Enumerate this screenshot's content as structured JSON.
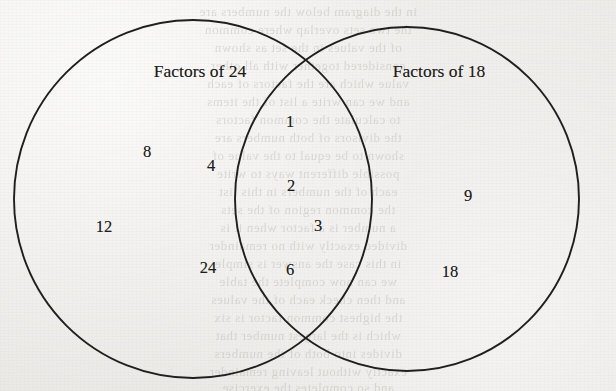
{
  "diagram": {
    "type": "venn-2-set",
    "title_left": "Factors of 24",
    "title_right": "Factors of 18",
    "stroke_color": "#201f1d",
    "background_color": "#efeeec",
    "text_color": "#1e1d1c",
    "left_circle": {
      "cx": 193,
      "cy": 199,
      "r": 179
    },
    "right_circle": {
      "cx": 407,
      "cy": 199,
      "r": 172
    },
    "labels": [
      {
        "name": "left-set-label",
        "text": "Factors of 24",
        "x": 200,
        "y": 71
      },
      {
        "name": "right-set-label",
        "text": "Factors of 18",
        "x": 439,
        "y": 71
      }
    ],
    "regions": {
      "left_only": {
        "name": "Factors of 24 only",
        "items": [
          {
            "value": "8",
            "x": 147,
            "y": 152
          },
          {
            "value": "4",
            "x": 211,
            "y": 166
          },
          {
            "value": "12",
            "x": 104,
            "y": 227
          },
          {
            "value": "24",
            "x": 208,
            "y": 268
          }
        ]
      },
      "intersection": {
        "name": "Common factors of 24 and 18",
        "items": [
          {
            "value": "1",
            "x": 290,
            "y": 122
          },
          {
            "value": "2",
            "x": 291,
            "y": 186
          },
          {
            "value": "3",
            "x": 318,
            "y": 226
          },
          {
            "value": "6",
            "x": 290,
            "y": 270
          }
        ]
      },
      "right_only": {
        "name": "Factors of 18 only",
        "items": [
          {
            "value": "9",
            "x": 468,
            "y": 196
          },
          {
            "value": "18",
            "x": 450,
            "y": 272
          }
        ]
      }
    }
  },
  "chart_data": {
    "type": "venn",
    "title": "",
    "sets": [
      {
        "name": "Factors of 24",
        "elements": [
          "1",
          "2",
          "3",
          "4",
          "6",
          "8",
          "12",
          "24"
        ]
      },
      {
        "name": "Factors of 18",
        "elements": [
          "1",
          "2",
          "3",
          "6",
          "9",
          "18"
        ]
      }
    ],
    "left_only": [
      "8",
      "4",
      "12",
      "24"
    ],
    "intersection": [
      "1",
      "2",
      "3",
      "6"
    ],
    "right_only": [
      "9",
      "18"
    ]
  },
  "background": {
    "ghost_lines": [
      {
        "text": "in the diagram below the numbers are",
        "y": 4
      },
      {
        "text": "the two sets overlap where common",
        "y": 22
      },
      {
        "text": "of the values in the set as shown",
        "y": 40
      },
      {
        "text": "considered together with all other",
        "y": 58
      },
      {
        "text": "value which are the factors of each",
        "y": 76
      },
      {
        "text": "and we can write a list of the items",
        "y": 94
      },
      {
        "text": "to calculate the common factors",
        "y": 112
      },
      {
        "text": "the divisors of both numbers are",
        "y": 130
      },
      {
        "text": "shown to be equal to the value of",
        "y": 148
      },
      {
        "text": "possible different ways to write",
        "y": 166
      },
      {
        "text": "each of the numbers in this list",
        "y": 184
      },
      {
        "text": "the common region of the sets",
        "y": 202
      },
      {
        "text": "a number is a factor when it is",
        "y": 220
      },
      {
        "text": "divided exactly with no remainder",
        "y": 238
      },
      {
        "text": "in this case the answer is simple",
        "y": 256
      },
      {
        "text": "we can now complete the table",
        "y": 274
      },
      {
        "text": "and then check each of the values",
        "y": 292
      },
      {
        "text": "the highest common factor is six",
        "y": 310
      },
      {
        "text": "which is the largest number that",
        "y": 328
      },
      {
        "text": "divides into both of the numbers",
        "y": 346
      },
      {
        "text": "exactly without leaving remainder",
        "y": 364
      },
      {
        "text": "and so completes the exercise",
        "y": 380
      }
    ]
  }
}
